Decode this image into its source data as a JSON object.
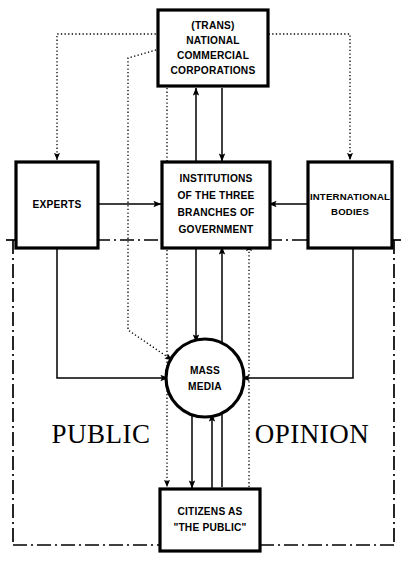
{
  "diagram": {
    "region_label_left": "PUBLIC",
    "region_label_right": "OPINION",
    "colors": {
      "stroke": "#000000",
      "fill": "#ffffff"
    },
    "nodes": [
      {
        "id": "corporations",
        "shape": "rect",
        "lines": [
          "(TRANS)",
          "NATIONAL",
          "COMMERCIAL",
          "CORPORATIONS"
        ]
      },
      {
        "id": "experts",
        "shape": "rect",
        "lines": [
          "EXPERTS"
        ]
      },
      {
        "id": "institutions",
        "shape": "rect",
        "lines": [
          "INSTITUTIONS",
          "OF THE THREE",
          "BRANCHES OF",
          "GOVERNMENT"
        ]
      },
      {
        "id": "international",
        "shape": "rect",
        "lines": [
          "INTERNATIONAL",
          "BODIES"
        ]
      },
      {
        "id": "mass-media",
        "shape": "circle",
        "lines": [
          "MASS",
          "MEDIA"
        ]
      },
      {
        "id": "citizens",
        "shape": "rect",
        "lines": [
          "CITIZENS AS",
          "\"THE PUBLIC\""
        ]
      }
    ],
    "edges": [
      {
        "from": "institutions",
        "to": "corporations",
        "style": "solid"
      },
      {
        "from": "corporations",
        "to": "institutions",
        "style": "solid"
      },
      {
        "from": "corporations",
        "to": "experts",
        "style": "dotted"
      },
      {
        "from": "corporations",
        "to": "international",
        "style": "dotted"
      },
      {
        "from": "corporations",
        "to": "mass-media",
        "style": "dotted"
      },
      {
        "from": "experts",
        "to": "institutions",
        "style": "solid"
      },
      {
        "from": "international",
        "to": "institutions",
        "style": "solid"
      },
      {
        "from": "experts",
        "to": "mass-media",
        "style": "solid"
      },
      {
        "from": "international",
        "to": "mass-media",
        "style": "solid"
      },
      {
        "from": "institutions",
        "to": "mass-media",
        "style": "solid"
      },
      {
        "from": "mass-media",
        "to": "citizens",
        "style": "solid"
      },
      {
        "from": "citizens",
        "to": "mass-media",
        "style": "solid"
      },
      {
        "from": "citizens",
        "to": "institutions",
        "style": "solid"
      },
      {
        "from": "corporations",
        "to": "citizens",
        "style": "dotted"
      },
      {
        "from": "citizens",
        "to": "institutions",
        "style": "dotted"
      }
    ],
    "boundary": {
      "name": "public-opinion-region",
      "style": "dash-dot"
    }
  }
}
